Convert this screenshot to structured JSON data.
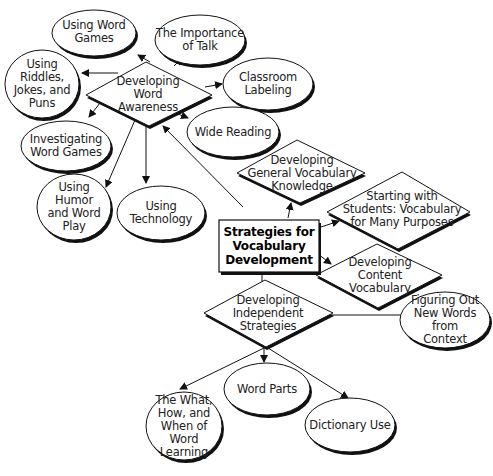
{
  "diagram": {
    "central": {
      "label": "Strategies for\nVocabulary\nDevelopment"
    },
    "branches": [
      {
        "id": "word-awareness",
        "label": "Developing\nWord\nAwareness"
      },
      {
        "id": "general-vocab",
        "label": "Developing\nGeneral Vocabulary\nKnowledge"
      },
      {
        "id": "starting-students",
        "label": "Starting with\nStudents: Vocabulary\nfor Many Purposes"
      },
      {
        "id": "content-vocab",
        "label": "Developing\nContent\nVocabulary"
      },
      {
        "id": "independent",
        "label": "Developing\nIndependent\nStrategies"
      }
    ],
    "word_awareness_children": [
      {
        "id": "word-games",
        "label": "Using Word\nGames"
      },
      {
        "id": "importance-talk",
        "label": "The Importance\nof Talk"
      },
      {
        "id": "riddles",
        "label": "Using\nRiddles,\nJokes, and\nPuns"
      },
      {
        "id": "classroom-labeling",
        "label": "Classroom\nLabeling"
      },
      {
        "id": "investigating",
        "label": "Investigating\nWord Games"
      },
      {
        "id": "wide-reading",
        "label": "Wide Reading"
      },
      {
        "id": "humor",
        "label": "Using\nHumor\nand Word\nPlay"
      },
      {
        "id": "technology",
        "label": "Using\nTechnology"
      }
    ],
    "independent_children": [
      {
        "id": "context",
        "label": "Figuring Out\nNew Words from\nContext"
      },
      {
        "id": "what-how-when",
        "label": "The What,\nHow, and\nWhen of Word\nLearning"
      },
      {
        "id": "word-parts",
        "label": "Word Parts"
      },
      {
        "id": "dictionary",
        "label": "Dictionary Use"
      }
    ]
  },
  "colors": {
    "stroke": "#111111",
    "fill": "#ffffff",
    "text": "#222222"
  }
}
